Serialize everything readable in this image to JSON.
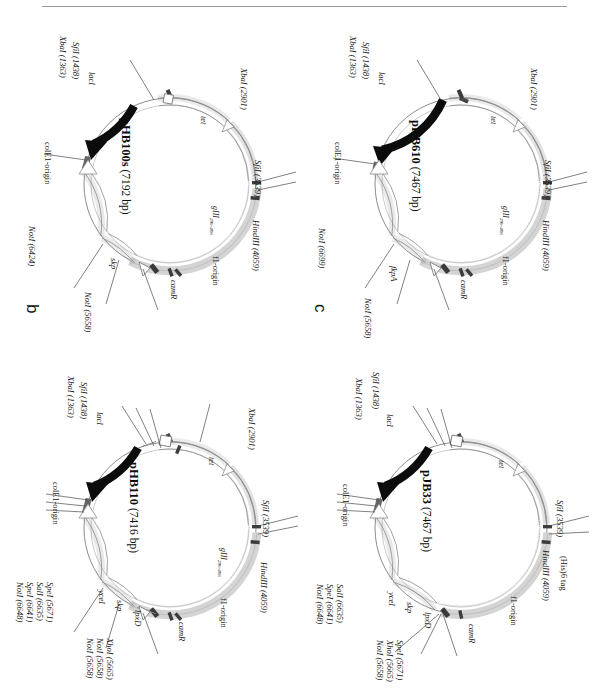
{
  "figure": {
    "type": "plasmid-map-figure",
    "panel_count": 4,
    "orientation_note": "landscape figure rotated 90 degrees clockwise on a portrait page",
    "colors": {
      "tet_arc": "#d6d6d6",
      "backbone": "#f2f2f2",
      "gene_filled": "#111111",
      "site_tick": "#4a4a4a",
      "outline": "#7d7d7d"
    }
  },
  "panels": [
    {
      "id": "a",
      "label": "a",
      "plasmid_name": "pHB110",
      "size_text": "(7416 bp)",
      "genes": [
        {
          "name": "lacI",
          "angle": 312
        },
        {
          "name": "tet",
          "angle": 52
        },
        {
          "name": "gIII",
          "sub": "29b-406",
          "angle": 112
        },
        {
          "name": "f1-origin",
          "angle": 140
        },
        {
          "name": "camR",
          "angle": 196
        },
        {
          "name": "lpxD",
          "angle": 228
        },
        {
          "name": "skp",
          "angle": 243
        },
        {
          "name": "yceI",
          "angle": 258
        },
        {
          "name": "colE1-origin",
          "angle": 288
        }
      ],
      "sites": [
        {
          "name": "XbaI",
          "pos": "1363",
          "text": "XbaI (1363)"
        },
        {
          "name": "SfiI",
          "pos": "1438",
          "text": "SfiI (1438)"
        },
        {
          "name": "XbaI",
          "pos": "2901",
          "text": "XbaI (2901)"
        },
        {
          "name": "SfiI",
          "pos": "3539",
          "text": "SfiI (3539)"
        },
        {
          "name": "HindIII",
          "pos": "4059",
          "text": "HindIII (4059)"
        },
        {
          "name": "NotI",
          "pos": "5658",
          "text": "NotI (5658)"
        },
        {
          "name": "XhoI",
          "pos": "5665",
          "text": "XhoI (5665)"
        },
        {
          "name": "SpeI",
          "pos": "5671",
          "text": "SpeI (5671)"
        },
        {
          "name": "SalI",
          "pos": "6635",
          "text": "SalI (6635)"
        },
        {
          "name": "SpeI",
          "pos": "6641",
          "text": "SpeI (6641)"
        },
        {
          "name": "NotI",
          "pos": "6648",
          "text": "NotI (6648)"
        }
      ]
    },
    {
      "id": "b",
      "label": "b",
      "plasmid_name": "pHB100s",
      "size_text": "(7192 bp)",
      "genes": [
        {
          "name": "lacI",
          "angle": 312
        },
        {
          "name": "tet",
          "angle": 52
        },
        {
          "name": "gIII",
          "sub": "29b-406",
          "angle": 112
        },
        {
          "name": "f1-origin",
          "angle": 140
        },
        {
          "name": "camR",
          "angle": 196
        },
        {
          "name": "skp",
          "angle": 243
        },
        {
          "name": "colE1-origin",
          "angle": 288
        }
      ],
      "sites": [
        {
          "name": "XbaI",
          "pos": "1363",
          "text": "XbaI (1363)"
        },
        {
          "name": "SfiI",
          "pos": "1438",
          "text": "SfiI (1438)"
        },
        {
          "name": "XbaI",
          "pos": "2901",
          "text": "XbaI (2901)"
        },
        {
          "name": "SfiI",
          "pos": "3539",
          "text": "SfiI (3539)"
        },
        {
          "name": "HindIII",
          "pos": "4059",
          "text": "HindIII (4059)"
        },
        {
          "name": "NotI",
          "pos": "5658",
          "text": "NotI (5658)"
        },
        {
          "name": "NotI",
          "pos": "6424",
          "text": "NotI (6424)"
        }
      ]
    },
    {
      "id": "c",
      "label": "c",
      "plasmid_name": "pHB610",
      "size_text": "(7467 bp)",
      "genes": [
        {
          "name": "lacI",
          "angle": 312
        },
        {
          "name": "tet",
          "angle": 52
        },
        {
          "name": "gIII",
          "sub": "29b-406",
          "angle": 112
        },
        {
          "name": "f1-origin",
          "angle": 140
        },
        {
          "name": "camR",
          "angle": 196
        },
        {
          "name": "fkpA",
          "angle": 243
        },
        {
          "name": "colE1-origin",
          "angle": 288
        }
      ],
      "sites": [
        {
          "name": "XbaI",
          "pos": "1363",
          "text": "XbaI (1363)"
        },
        {
          "name": "SfiI",
          "pos": "1438",
          "text": "SfiI (1438)"
        },
        {
          "name": "XbaI",
          "pos": "2901",
          "text": "XbaI (2901)"
        },
        {
          "name": "SfiI",
          "pos": "3539",
          "text": "SfiI (3539)"
        },
        {
          "name": "HindIII",
          "pos": "4059",
          "text": "HindIII (4059)"
        },
        {
          "name": "NotI",
          "pos": "5658",
          "text": "NotI (5658)"
        },
        {
          "name": "NotI",
          "pos": "6699",
          "text": "NotI (6699)"
        }
      ]
    },
    {
      "id": "d",
      "label": "d",
      "plasmid_name": "pJB33",
      "size_text": "(7467 bp)",
      "genes": [
        {
          "name": "lacI",
          "angle": 312
        },
        {
          "name": "tet",
          "angle": 52
        },
        {
          "name": "f1-origin",
          "angle": 140
        },
        {
          "name": "camR",
          "angle": 196
        },
        {
          "name": "lpxD",
          "angle": 228
        },
        {
          "name": "skp",
          "angle": 243
        },
        {
          "name": "yceI",
          "angle": 258
        },
        {
          "name": "colE1-origin",
          "angle": 288
        }
      ],
      "sites": [
        {
          "name": "XbaI",
          "pos": "1363",
          "text": "XbaI (1363)"
        },
        {
          "name": "SfiI",
          "pos": "1438",
          "text": "SfiI (1438)"
        },
        {
          "name": "SfiI",
          "pos": "3539",
          "text": "SfiI (3539)"
        },
        {
          "name": "HindIII",
          "pos": "4059",
          "text": "HindIII (4059)"
        },
        {
          "name": "His6tag",
          "pos": "",
          "text": "(His)6 tag"
        },
        {
          "name": "NotI",
          "pos": "5658",
          "text": "NotI (5658)"
        },
        {
          "name": "XhoI",
          "pos": "5665",
          "text": "XhoI (5665)"
        },
        {
          "name": "SpeI",
          "pos": "5671",
          "text": "SpeI (5671)"
        },
        {
          "name": "SalI",
          "pos": "6635",
          "text": "SalI (6635)"
        },
        {
          "name": "SpeI",
          "pos": "6641",
          "text": "SpeI (6641)"
        },
        {
          "name": "NotI",
          "pos": "6648",
          "text": "NotI (6648)"
        }
      ]
    }
  ]
}
